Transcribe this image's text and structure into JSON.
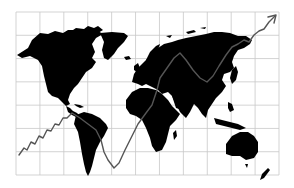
{
  "illustration": {
    "subject": "world-map-with-growth-trend-line",
    "colors": {
      "background": "#ffffff",
      "grid": "#c8c8c8",
      "landmass": "#000000",
      "trend_line": "#555555"
    },
    "grid": {
      "x_start": 16,
      "x_end": 279,
      "columns": 11,
      "y_start": 12,
      "y_end": 175,
      "rows": 7
    },
    "trend_line": {
      "points": [
        [
          19,
          155
        ],
        [
          24,
          148
        ],
        [
          27,
          150
        ],
        [
          31,
          142
        ],
        [
          35,
          144
        ],
        [
          39,
          136
        ],
        [
          43,
          138
        ],
        [
          47,
          130
        ],
        [
          51,
          131
        ],
        [
          55,
          124
        ],
        [
          59,
          125
        ],
        [
          63,
          118
        ],
        [
          67,
          118
        ],
        [
          72,
          113
        ],
        [
          80,
          118
        ],
        [
          88,
          124
        ],
        [
          96,
          130
        ],
        [
          101,
          140
        ],
        [
          104,
          152
        ],
        [
          108,
          160
        ],
        [
          114,
          168
        ],
        [
          119,
          163
        ],
        [
          125,
          150
        ],
        [
          131,
          138
        ],
        [
          138,
          124
        ],
        [
          146,
          113
        ],
        [
          152,
          105
        ],
        [
          157,
          90
        ],
        [
          160,
          78
        ],
        [
          167,
          68
        ],
        [
          174,
          58
        ],
        [
          180,
          53
        ],
        [
          186,
          60
        ],
        [
          193,
          70
        ],
        [
          200,
          78
        ],
        [
          207,
          82
        ],
        [
          213,
          76
        ],
        [
          219,
          66
        ],
        [
          226,
          55
        ],
        [
          232,
          47
        ],
        [
          238,
          44
        ],
        [
          244,
          40
        ],
        [
          249,
          42
        ],
        [
          254,
          35
        ],
        [
          259,
          31
        ],
        [
          264,
          29
        ],
        [
          269,
          22
        ],
        [
          275,
          16
        ]
      ],
      "arrow_head": {
        "tip": [
          276,
          15
        ],
        "left": [
          268,
          17
        ],
        "right": [
          274,
          23
        ]
      }
    }
  }
}
